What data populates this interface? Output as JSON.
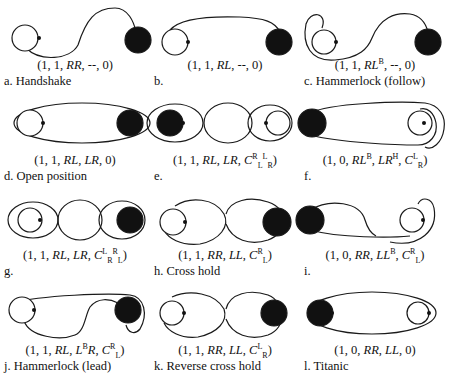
{
  "figure": {
    "legend": {
      "white_circle": "follower",
      "black_circle": "leader"
    },
    "panels": [
      {
        "id": "a",
        "notation": "(1, 1, RR, --, 0)",
        "caption": "a. Handshake"
      },
      {
        "id": "b",
        "notation": "(1, 1, RL, --, 0)",
        "caption": "b."
      },
      {
        "id": "c",
        "notation": "(1, 1, RL^B, --, 0)",
        "caption": "c. Hammerlock (follow)"
      },
      {
        "id": "d",
        "notation": "(1, 1, RL, LR, 0)",
        "caption": "d. Open position"
      },
      {
        "id": "e",
        "notation": "(1, 1, RL, LR, C^R_L^L_R)",
        "caption": "e."
      },
      {
        "id": "f",
        "notation": "(1, 0, RL^B, LR^H, C^L_R)",
        "caption": "f."
      },
      {
        "id": "g",
        "notation": "(1, 1, RL, LR, C^L_R^R_L)",
        "caption": "g."
      },
      {
        "id": "h",
        "notation": "(1, 1, RR, LL, C^R_L)",
        "caption": "h. Cross hold"
      },
      {
        "id": "i",
        "notation": "(1, 0, RR, LL^B, C^R_L)",
        "caption": "i."
      },
      {
        "id": "j",
        "notation": "(1, 1, RL, L^BR, C^R_L)",
        "caption": "j. Hammerlock (lead)"
      },
      {
        "id": "k",
        "notation": "(1, 1, RR, LL, C^L_R)",
        "caption": "k. Reverse cross hold"
      },
      {
        "id": "l",
        "notation": "(1, 0, RR, LL, 0)",
        "caption": "l. Titanic"
      }
    ],
    "notation_parts": {
      "a": {
        "p1": "(1, 1, ",
        "h1": "RR",
        "p2": ", --, 0)"
      },
      "b": {
        "p1": "(1, 1, ",
        "h1": "RL",
        "p2": ", --, 0)"
      },
      "c": {
        "p1": "(1, 1, ",
        "h1": "RL",
        "s1": "B",
        "p2": ", --, 0)"
      },
      "d": {
        "p1": "(1, 1, ",
        "h1": "RL",
        "p2": ", ",
        "h2": "LR",
        "p3": ", 0)"
      },
      "e": {
        "p1": "(1, 1, ",
        "h1": "RL",
        "p2": ", ",
        "h2": "LR",
        "p3": ", ",
        "c": "C",
        "cs1": "R",
        "cb1": "L",
        "cs2": "L",
        "cb2": "R",
        "p4": ")"
      },
      "f": {
        "p1": "(1, 0, ",
        "h1": "RL",
        "s1": "B",
        "p2": ", ",
        "h2": "LR",
        "s2": "H",
        "p3": ", ",
        "c": "C",
        "cs1": "L",
        "cb1": "R",
        "p4": ")"
      },
      "g": {
        "p1": "(1, 1, ",
        "h1": "RL",
        "p2": ", ",
        "h2": "LR",
        "p3": ", ",
        "c": "C",
        "cs1": "L",
        "cb1": "R",
        "cs2": "R",
        "cb2": "L",
        "p4": ")"
      },
      "h": {
        "p1": "(1, 1, ",
        "h1": "RR",
        "p2": ", ",
        "h2": "LL",
        "p3": ", ",
        "c": "C",
        "cs1": "R",
        "cb1": "L",
        "p4": ")"
      },
      "i": {
        "p1": "(1, 0, ",
        "h1": "RR",
        "p2": ", ",
        "h2": "LL",
        "s2": "B",
        "p3": ", ",
        "c": "C",
        "cs1": "R",
        "cb1": "L",
        "p4": ")"
      },
      "j": {
        "p1": "(1, 1, ",
        "h1": "RL",
        "p2": ", ",
        "h2a": "L",
        "s2": "B",
        "h2b": "R",
        "p3": ", ",
        "c": "C",
        "cs1": "R",
        "cb1": "L",
        "p4": ")"
      },
      "k": {
        "p1": "(1, 1, ",
        "h1": "RR",
        "p2": ", ",
        "h2": "LL",
        "p3": ", ",
        "c": "C",
        "cs1": "L",
        "cb1": "R",
        "p4": ")"
      },
      "l": {
        "p1": "(1, 0, ",
        "h1": "RR",
        "p2": ", ",
        "h2": "LL",
        "p3": ", 0)"
      }
    }
  }
}
